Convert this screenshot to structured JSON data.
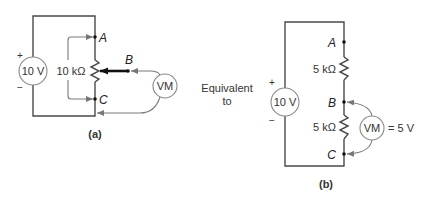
{
  "figure_a": {
    "caption": "(a)",
    "source_label": "10 V",
    "plus": "+",
    "minus": "−",
    "pot_label": "10 kΩ",
    "node_a": "A",
    "node_b": "B",
    "node_c": "C",
    "meter_label": "VM"
  },
  "middle": {
    "line1": "Equivalent",
    "line2": "to"
  },
  "figure_b": {
    "caption": "(b)",
    "source_label": "10 V",
    "plus": "+",
    "minus": "−",
    "r1_label": "5 kΩ",
    "r2_label": "5 kΩ",
    "node_a": "A",
    "node_b": "B",
    "node_c": "C",
    "meter_label": "VM",
    "meter_reading": "= 5 V"
  }
}
